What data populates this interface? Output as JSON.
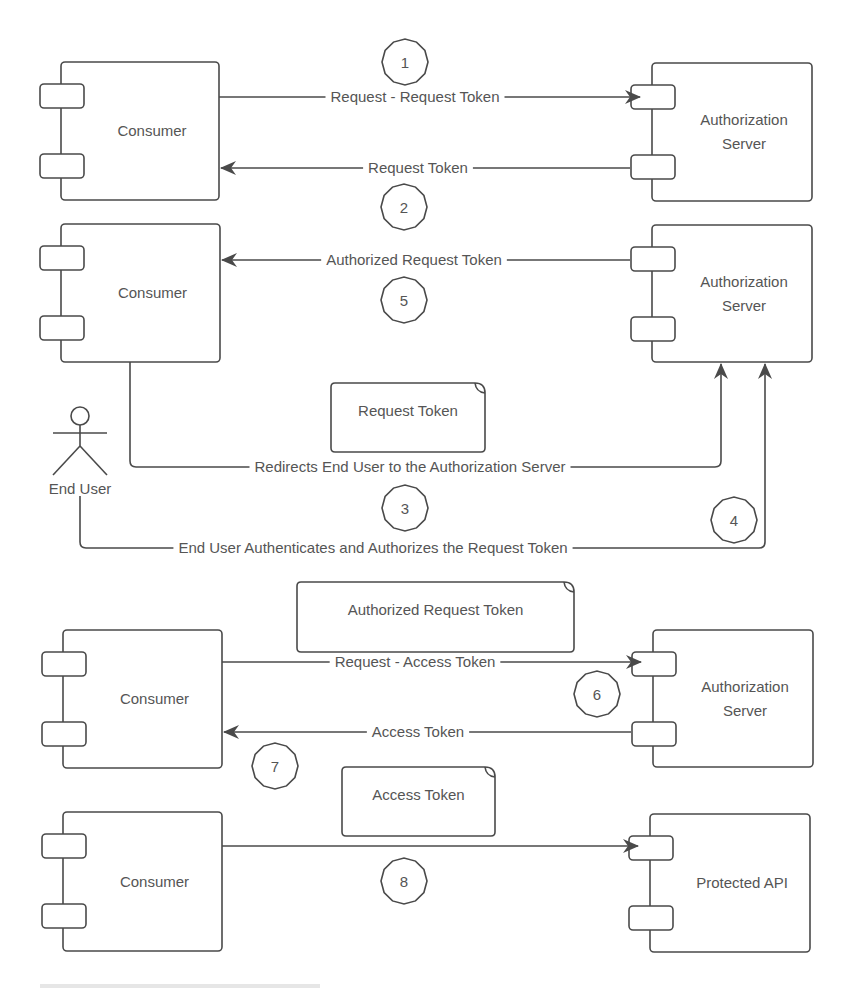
{
  "colors": {
    "stroke": "#4a4a4a",
    "text": "#555555",
    "background": "#ffffff"
  },
  "components": [
    {
      "id": "consumer-1",
      "label": [
        "Consumer"
      ],
      "x": 61,
      "y": 62,
      "w": 158,
      "h": 138
    },
    {
      "id": "auth-server-1",
      "label": [
        "Authorization",
        "Server"
      ],
      "x": 652,
      "y": 63,
      "w": 160,
      "h": 138
    },
    {
      "id": "consumer-2",
      "label": [
        "Consumer"
      ],
      "x": 61,
      "y": 224,
      "w": 159,
      "h": 138
    },
    {
      "id": "auth-server-2",
      "label": [
        "Authorization",
        "Server"
      ],
      "x": 652,
      "y": 225,
      "w": 160,
      "h": 137
    },
    {
      "id": "consumer-3",
      "label": [
        "Consumer"
      ],
      "x": 63,
      "y": 630,
      "w": 159,
      "h": 138
    },
    {
      "id": "auth-server-3",
      "label": [
        "Authorization",
        "Server"
      ],
      "x": 653,
      "y": 630,
      "w": 160,
      "h": 137
    },
    {
      "id": "consumer-4",
      "label": [
        "Consumer"
      ],
      "x": 63,
      "y": 812,
      "w": 159,
      "h": 139
    },
    {
      "id": "protected-api",
      "label": [
        "Protected API"
      ],
      "x": 650,
      "y": 814,
      "w": 160,
      "h": 138
    }
  ],
  "actor": {
    "label": "End User",
    "cx": 80,
    "head_cy": 416
  },
  "notes": [
    {
      "id": "note-request-token",
      "label": "Request Token",
      "x": 331,
      "y": 383,
      "w": 154,
      "h": 69
    },
    {
      "id": "note-authorized-request-token",
      "label": "Authorized Request Token",
      "x": 297,
      "y": 582,
      "w": 277,
      "h": 70
    },
    {
      "id": "note-access-token",
      "label": "Access Token",
      "x": 342,
      "y": 767,
      "w": 153,
      "h": 69
    }
  ],
  "messages": [
    {
      "id": "msg-request-request-token",
      "label": "Request - Request Token",
      "label_x": 415,
      "y": 97,
      "x1": 219,
      "x2": 640,
      "direction": "right"
    },
    {
      "id": "msg-request-token",
      "label": "Request Token",
      "label_x": 418,
      "y": 168,
      "x1": 221,
      "x2": 630,
      "direction": "left"
    },
    {
      "id": "msg-authorized-request-token",
      "label": "Authorized Request Token",
      "label_x": 414,
      "y": 260,
      "x1": 222,
      "x2": 630,
      "direction": "left"
    },
    {
      "id": "msg-redirects-end-user",
      "label": "Redirects End User to the Authorization Server",
      "label_x": 410,
      "y": 467
    },
    {
      "id": "msg-end-user-authenticates",
      "label": "End User Authenticates and Authorizes the Request Token",
      "label_x": 373,
      "y": 548
    },
    {
      "id": "msg-request-access-token",
      "label": "Request - Access Token",
      "label_x": 415,
      "y": 662,
      "x1": 222,
      "x2": 641,
      "direction": "right"
    },
    {
      "id": "msg-access-token",
      "label": "Access Token",
      "label_x": 418,
      "y": 732,
      "x1": 224,
      "x2": 631,
      "direction": "left"
    },
    {
      "id": "msg-access-protected-api",
      "label": "",
      "y": 846,
      "x1": 222,
      "x2": 638,
      "direction": "right"
    }
  ],
  "steps": [
    {
      "n": "1",
      "cx": 405,
      "cy": 62
    },
    {
      "n": "2",
      "cx": 404,
      "cy": 207
    },
    {
      "n": "5",
      "cx": 404,
      "cy": 300
    },
    {
      "n": "3",
      "cx": 405,
      "cy": 508
    },
    {
      "n": "4",
      "cx": 734,
      "cy": 520
    },
    {
      "n": "6",
      "cx": 597,
      "cy": 694
    },
    {
      "n": "7",
      "cx": 275,
      "cy": 766
    },
    {
      "n": "8",
      "cx": 404,
      "cy": 881
    }
  ]
}
